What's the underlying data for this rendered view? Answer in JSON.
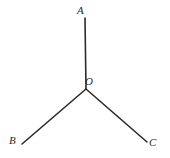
{
  "figure": {
    "background_color": "#ffffff",
    "line_color": "#2b2b2b",
    "label_color": "#2b2b2b",
    "width": 170,
    "height": 158,
    "vertex_label": "O",
    "labels": {
      "A": "A",
      "B": "B",
      "C": "C",
      "O": "O"
    }
  },
  "chart_data": {
    "type": "diagram",
    "points": [
      {
        "name": "A",
        "x": 85,
        "y": 18
      },
      {
        "name": "O",
        "x": 86,
        "y": 89
      },
      {
        "name": "B",
        "x": 22,
        "y": 144
      },
      {
        "name": "C",
        "x": 147,
        "y": 142
      }
    ],
    "segments": [
      {
        "name": "OA",
        "from": "O",
        "to": "A",
        "x1": 86,
        "y1": 89,
        "x2": 85,
        "y2": 18
      },
      {
        "name": "OB",
        "from": "O",
        "to": "B",
        "x1": 86,
        "y1": 89,
        "x2": 22,
        "y2": 144
      },
      {
        "name": "OC",
        "from": "O",
        "to": "C",
        "x1": 86,
        "y1": 89,
        "x2": 147,
        "y2": 142
      }
    ],
    "label_positions": [
      {
        "name": "A",
        "x": 77,
        "y": 5
      },
      {
        "name": "O",
        "x": 85,
        "y": 76
      },
      {
        "name": "B",
        "x": 9,
        "y": 135
      },
      {
        "name": "C",
        "x": 149,
        "y": 137
      }
    ]
  }
}
